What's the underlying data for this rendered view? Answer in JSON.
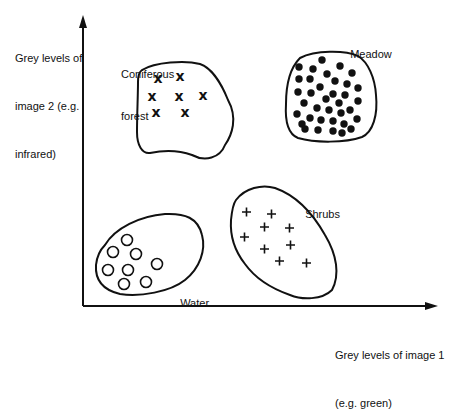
{
  "axes": {
    "y_label_line1": "Grey levels of",
    "y_label_line2": "image 2 (e.g.",
    "y_label_line3": "infrared)",
    "x_label_line1": "Grey levels of image 1",
    "x_label_line2": "(e.g. green)"
  },
  "clusters": [
    {
      "name": "Coniferous forest",
      "label_line1": "Coniferous",
      "label_line2": "forest",
      "marker": "x",
      "count": 7
    },
    {
      "name": "Meadow",
      "label_line1": "Meadow",
      "marker": "filled-circle",
      "count": 36
    },
    {
      "name": "Shrubs",
      "label_line1": "Shrubs",
      "marker": "plus",
      "count": 9
    },
    {
      "name": "Water",
      "label_line1": "Water",
      "marker": "open-circle",
      "count": 8
    }
  ],
  "colors": {
    "stroke": "#111111",
    "background": "#ffffff"
  }
}
